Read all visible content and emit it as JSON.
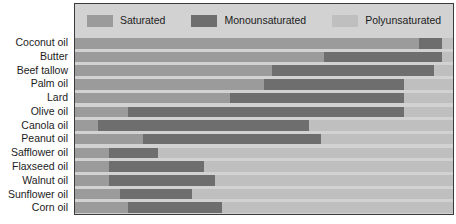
{
  "chart_data": {
    "type": "bar",
    "orientation": "horizontal",
    "stacked": true,
    "stack_mode": "percent",
    "title": "",
    "subtitle": "",
    "xlabel": "",
    "ylabel": "",
    "xlim": [
      0,
      100
    ],
    "grid": false,
    "legend_position": "top",
    "categories": [
      "Coconut oil",
      "Butter",
      "Beef tallow",
      "Palm oil",
      "Lard",
      "Olive oil",
      "Canola oil",
      "Peanut oil",
      "Safflower oil",
      "Flaxseed oil",
      "Walnut oil",
      "Sunflower oil",
      "Corn oil"
    ],
    "series": [
      {
        "name": "Saturated",
        "color": "#9b9b9b",
        "values": [
          91,
          66,
          52,
          50,
          41,
          14,
          6,
          18,
          9,
          9,
          9,
          12,
          14
        ]
      },
      {
        "name": "Monounsaturated",
        "color": "#6e6e6e",
        "values": [
          6,
          31,
          43,
          37,
          46,
          73,
          56,
          47,
          13,
          25,
          28,
          19,
          25
        ]
      },
      {
        "name": "Polyunsaturated",
        "color": "#bfbfbf",
        "values": [
          3,
          3,
          5,
          13,
          13,
          13,
          38,
          35,
          78,
          66,
          63,
          69,
          61
        ]
      }
    ]
  },
  "legend": {
    "items": [
      {
        "label": "Saturated",
        "swatch_name": "legend-swatch-saturated"
      },
      {
        "label": "Monounsaturated",
        "swatch_name": "legend-swatch-monounsaturated"
      },
      {
        "label": "Polyunsaturated",
        "swatch_name": "legend-swatch-polyunsaturated"
      }
    ]
  },
  "colors": {
    "saturated": "#9b9b9b",
    "monounsaturated": "#6e6e6e",
    "polyunsaturated": "#bfbfbf",
    "panel_background": "#d2d2d2",
    "panel_border": "#3a3a3a",
    "page_background": "#ffffff",
    "text": "#1c1c1c"
  }
}
